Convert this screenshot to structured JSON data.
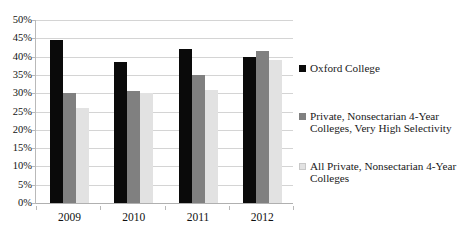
{
  "chart_data": {
    "type": "bar",
    "title": "",
    "subtitle": "",
    "xlabel": "",
    "ylabel": "",
    "categories": [
      "2009",
      "2010",
      "2011",
      "2012"
    ],
    "series": [
      {
        "name": "Oxford College",
        "color": "#0a0a0a",
        "values": [
          44.5,
          38.5,
          42.0,
          40.0
        ]
      },
      {
        "name": "Private, Nonsectarian 4-Year Colleges, Very High Selectivity",
        "color": "#808080",
        "values": [
          30.0,
          30.5,
          35.0,
          41.5
        ]
      },
      {
        "name": "All Private, Nonsectarian 4-Year Colleges",
        "color": "#e2e2e2",
        "values": [
          26.0,
          30.0,
          31.0,
          39.0
        ]
      }
    ],
    "ylim": [
      0,
      50
    ],
    "ytick_step": 5,
    "ytick_labels": [
      "0%",
      "5%",
      "10%",
      "15%",
      "20%",
      "25%",
      "30%",
      "35%",
      "40%",
      "45%",
      "50%"
    ],
    "ytick_values": [
      0,
      5,
      10,
      15,
      20,
      25,
      30,
      35,
      40,
      45,
      50
    ],
    "value_format": "percent",
    "grid": true,
    "grid_axis": "y",
    "legend_position": "right"
  },
  "legend": {
    "entries": [
      {
        "label": "Oxford College",
        "color": "#0a0a0a"
      },
      {
        "label": "Private, Nonsectarian 4-Year Colleges, Very High Selectivity",
        "color": "#808080"
      },
      {
        "label": "All Private, Nonsectarian 4-Year Colleges",
        "color": "#e2e2e2"
      }
    ]
  }
}
